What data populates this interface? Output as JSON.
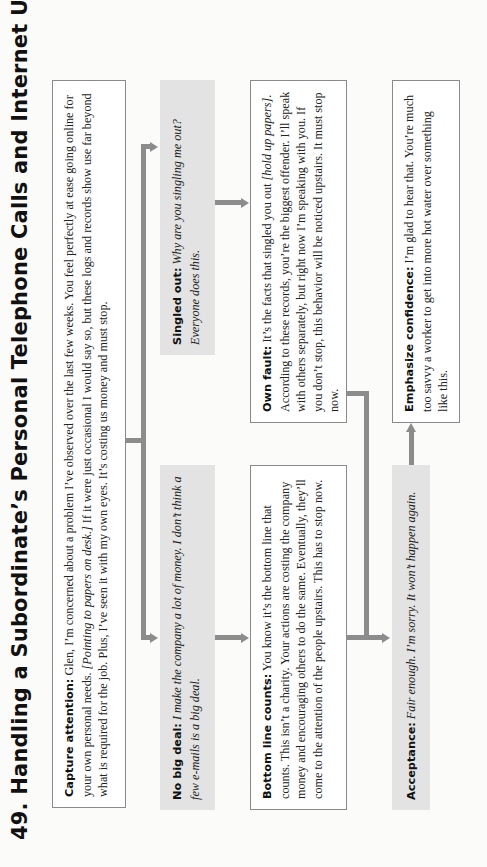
{
  "title": "49. Handling a Subordinate’s Personal Telephone Calls and Internet Use",
  "boxes": {
    "capture_attention": {
      "label": "Capture attention:",
      "text_1": " Glen, I’m concerned about a problem I’ve observed over the last few weeks. You feel perfectly at ease going online for your own personal needs. ",
      "stage_direction": "[Pointing to papers on desk.]",
      "text_2": " If it were just occasional I would say so, but these logs and records show use far beyond what is required for the job. Plus, I’ve seen it with my own eyes. It’s costing us money and must stop."
    },
    "no_big_deal": {
      "label": "No big deal:",
      "text": " I make the company a lot of money. I don’t think a few e-mails is a big deal."
    },
    "singled_out": {
      "label": "Singled out:",
      "text": " Why are you singling me out? Everyone does this."
    },
    "bottom_line": {
      "label": "Bottom line counts:",
      "text": " You know it’s the bottom line that counts. This isn’t a charity. Your actions are costing the company money and encouraging others to do the same. Eventually, they’ll come to the attention of the people upstairs. This has to stop now."
    },
    "own_fault": {
      "label": "Own fault:",
      "text_1": " It’s the facts that singled you out ",
      "stage_direction": "[hold up papers]",
      "text_2": ". According to these records, you’re the biggest offender. I’ll speak with others separately, but right now I’m speaking with you. If you don’t stop, this behavior will be noticed upstairs. It must stop now."
    },
    "acceptance": {
      "label": "Acceptance:",
      "text": " Fair enough. I’m sorry. It won’t happen again."
    },
    "emphasize_confidence": {
      "label": "Emphasize confidence:",
      "text": " I’m glad to hear that. You’re much too savvy a worker to get into more hot water over something like this."
    }
  },
  "colors": {
    "connector": "#8c8c8c",
    "gray_box": "#e3e3e3",
    "border": "#8a8a8a"
  }
}
